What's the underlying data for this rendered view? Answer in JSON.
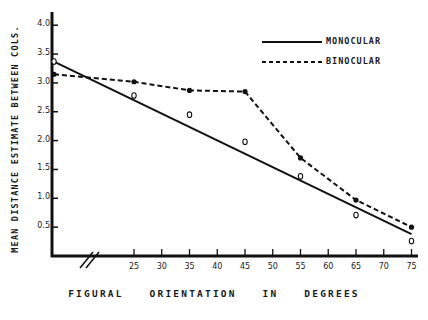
{
  "chart_data": {
    "type": "line",
    "title": "",
    "xlabel": "FIGURAL ORIENTATION IN DEGREES",
    "ylabel": "MEAN DISTANCE ESTIMATE BETWEEN COLS.",
    "x_ticks": [
      "25",
      "30",
      "35",
      "40",
      "45",
      "50",
      "55",
      "60",
      "65",
      "70",
      "75"
    ],
    "y_ticks": [
      "0.5",
      "1.0",
      "1.5",
      "2.0",
      "2.5",
      "3.0",
      "3.5",
      "4.0"
    ],
    "ylim": [
      0,
      4.0
    ],
    "xlim": [
      15,
      75
    ],
    "axis_break": true,
    "grid": false,
    "legend_position": "upper right",
    "x": [
      15,
      25,
      35,
      45,
      55,
      65,
      75
    ],
    "series": [
      {
        "name": "MONOCULAR",
        "line_style": "solid",
        "marker": "open circle",
        "values": [
          3.37,
          2.78,
          2.45,
          1.98,
          1.38,
          0.71,
          0.26
        ],
        "fit_line": {
          "x": [
            15,
            75
          ],
          "y": [
            3.37,
            0.38
          ]
        }
      },
      {
        "name": "BINOCULAR",
        "line_style": "dashed",
        "marker": "filled circle",
        "values": [
          3.15,
          3.02,
          2.87,
          2.85,
          1.7,
          0.97,
          0.5
        ]
      }
    ]
  },
  "legend": {
    "monocular": "MONOCULAR",
    "binocular": "BINOCULAR"
  },
  "axes": {
    "xlabel": "FIGURAL ORIENTATION IN DEGREES",
    "ylabel": "MEAN DISTANCE ESTIMATE BETWEEN COLS."
  }
}
